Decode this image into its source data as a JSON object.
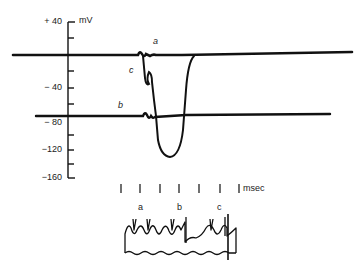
{
  "figure": {
    "type": "electrophysiology-recording",
    "y_axis": {
      "unit": "mV",
      "ticks": [
        {
          "value": 40,
          "label": "+ 40"
        },
        {
          "value": 20,
          "label": ""
        },
        {
          "value": 0,
          "label": ""
        },
        {
          "value": -20,
          "label": ""
        },
        {
          "value": -40,
          "label": "− 40"
        },
        {
          "value": -60,
          "label": ""
        },
        {
          "value": -80,
          "label": "− 80"
        },
        {
          "value": -100,
          "label": ""
        },
        {
          "value": -120,
          "label": "−120"
        },
        {
          "value": -140,
          "label": ""
        },
        {
          "value": -160,
          "label": "−160"
        }
      ]
    },
    "trace_labels": {
      "a": "a",
      "b": "b",
      "c": "c"
    },
    "time_marker": {
      "unit_label": "msec",
      "tick_count": 7
    },
    "stimulus_labels": {
      "a": "a",
      "b": "b",
      "c": "c"
    },
    "colors": {
      "ink": "#111111",
      "background": "#ffffff"
    }
  }
}
